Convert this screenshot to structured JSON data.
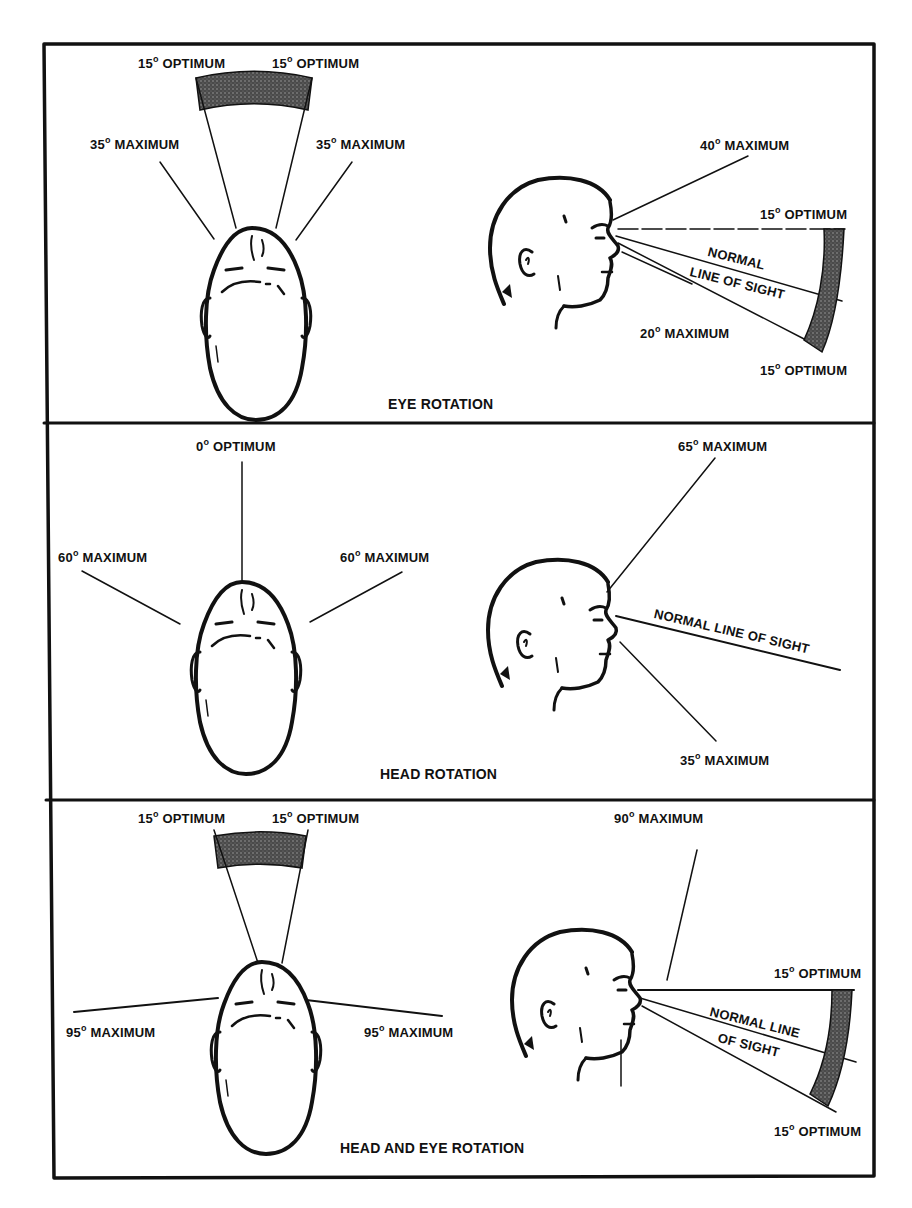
{
  "figure": {
    "panels": [
      {
        "title": "EYE ROTATION",
        "top_view": {
          "left_optimum": {
            "degrees": "15",
            "label": "OPTIMUM"
          },
          "right_optimum": {
            "degrees": "15",
            "label": "OPTIMUM"
          },
          "left_maximum": {
            "degrees": "35",
            "label": "MAXIMUM"
          },
          "right_maximum": {
            "degrees": "35",
            "label": "MAXIMUM"
          }
        },
        "side_view": {
          "up_maximum": {
            "degrees": "40",
            "label": "MAXIMUM"
          },
          "up_optimum": {
            "degrees": "15",
            "label": "OPTIMUM"
          },
          "line_of_sight_1": "NORMAL",
          "line_of_sight_2": "LINE OF SIGHT",
          "down_maximum": {
            "degrees": "20",
            "label": "MAXIMUM"
          },
          "down_optimum": {
            "degrees": "15",
            "label": "OPTIMUM"
          }
        }
      },
      {
        "title": "HEAD ROTATION",
        "top_view": {
          "center_optimum": {
            "degrees": "0",
            "label": "OPTIMUM"
          },
          "left_maximum": {
            "degrees": "60",
            "label": "MAXIMUM"
          },
          "right_maximum": {
            "degrees": "60",
            "label": "MAXIMUM"
          }
        },
        "side_view": {
          "up_maximum": {
            "degrees": "65",
            "label": "MAXIMUM"
          },
          "line_of_sight": "NORMAL LINE OF SIGHT",
          "down_maximum": {
            "degrees": "35",
            "label": "MAXIMUM"
          }
        }
      },
      {
        "title": "HEAD AND EYE ROTATION",
        "top_view": {
          "left_optimum": {
            "degrees": "15",
            "label": "OPTIMUM"
          },
          "right_optimum": {
            "degrees": "15",
            "label": "OPTIMUM"
          },
          "left_maximum": {
            "degrees": "95",
            "label": "MAXIMUM"
          },
          "right_maximum": {
            "degrees": "95",
            "label": "MAXIMUM"
          }
        },
        "side_view": {
          "up_maximum": {
            "degrees": "90",
            "label": "MAXIMUM"
          },
          "up_optimum": {
            "degrees": "15",
            "label": "OPTIMUM"
          },
          "line_of_sight_1": "NORMAL LINE",
          "line_of_sight_2": "OF SIGHT",
          "down_optimum": {
            "degrees": "15",
            "label": "OPTIMUM"
          }
        }
      }
    ],
    "degree_symbol": "o",
    "colors": {
      "ink": "#111111",
      "shade": "#555555",
      "background": "#ffffff"
    }
  }
}
